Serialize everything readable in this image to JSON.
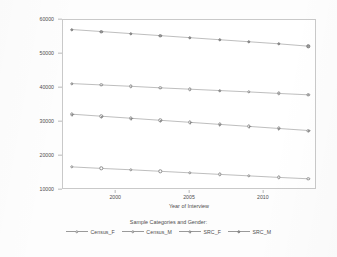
{
  "chart_data": {
    "type": "line",
    "title": "",
    "xlabel": "Year of Interview",
    "ylabel": "Predicted Mean Head Wage/Salary 1997 to 2013 (in 2013 Dollars)",
    "legend_title": "Sample Categories and Gender:",
    "legend_position": "bottom",
    "grid": false,
    "xlim": [
      1996.4,
      2013.6
    ],
    "ylim": [
      10000,
      60000
    ],
    "xticks": [
      2000,
      2005,
      2010
    ],
    "xtick_labels": [
      "2000",
      "2005",
      "2010"
    ],
    "yticks": [
      10000,
      20000,
      30000,
      40000,
      50000,
      60000
    ],
    "ytick_labels": [
      "10000",
      "20000",
      "30000",
      "40000",
      "50000",
      "60000"
    ],
    "x": [
      1997,
      1999,
      2001,
      2003,
      2005,
      2007,
      2009,
      2011,
      2013
    ],
    "series": [
      {
        "name": "Census_F",
        "marker": "circle-open",
        "values": [
          16800,
          16350,
          15950,
          15500,
          15050,
          14600,
          14150,
          13700,
          13300
        ]
      },
      {
        "name": "Census_M",
        "marker": "circle-dot",
        "values": [
          41300,
          40900,
          40500,
          40050,
          39650,
          39250,
          38850,
          38400,
          38000
        ]
      },
      {
        "name": "SRC_F",
        "marker": "circle-plus",
        "values": [
          32300,
          31700,
          31100,
          30500,
          29900,
          29300,
          28700,
          28100,
          27500
        ]
      },
      {
        "name": "SRC_M",
        "marker": "circle-filled",
        "values": [
          57200,
          56600,
          56000,
          55400,
          54800,
          54200,
          53600,
          53000,
          52300
        ]
      }
    ]
  },
  "colors": {
    "line": "#9a9a9a",
    "axis": "#c9c9c9",
    "text": "#4d4d4d",
    "plot_background": "#ffffff",
    "page_background": "#fdfdfd"
  }
}
